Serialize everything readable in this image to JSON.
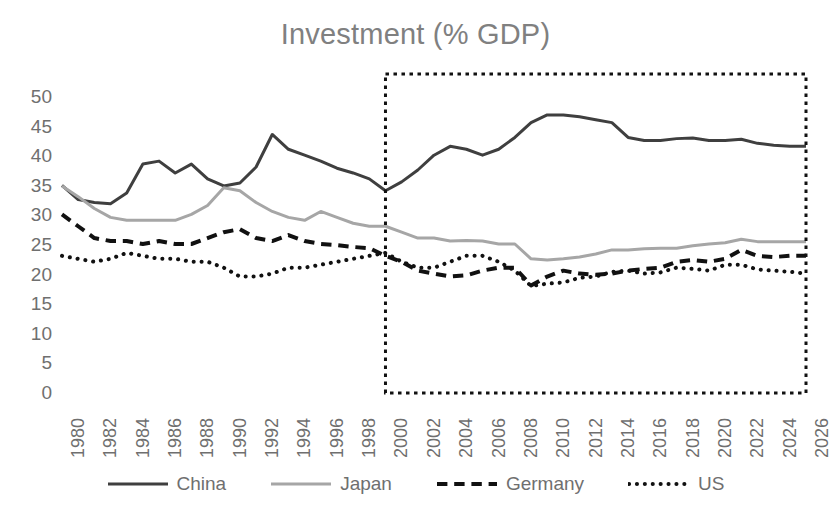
{
  "chart_data": {
    "type": "line",
    "title": "Investment (% GDP)",
    "xlabel": "",
    "ylabel": "",
    "ylim": [
      0,
      50
    ],
    "ytick_step": 5,
    "yticks": [
      50,
      45,
      40,
      35,
      30,
      25,
      20,
      15,
      10,
      5,
      0
    ],
    "xlim": [
      1980,
      2026
    ],
    "xticks": [
      1980,
      1982,
      1984,
      1986,
      1988,
      1990,
      1992,
      1994,
      1996,
      1998,
      2000,
      2002,
      2004,
      2006,
      2008,
      2010,
      2012,
      2014,
      2016,
      2018,
      2020,
      2022,
      2024,
      2026
    ],
    "x": [
      1980,
      1981,
      1982,
      1983,
      1984,
      1985,
      1986,
      1987,
      1988,
      1989,
      1990,
      1991,
      1992,
      1993,
      1994,
      1995,
      1996,
      1997,
      1998,
      1999,
      2000,
      2001,
      2002,
      2003,
      2004,
      2005,
      2006,
      2007,
      2008,
      2009,
      2010,
      2011,
      2012,
      2013,
      2014,
      2015,
      2016,
      2017,
      2018,
      2019,
      2020,
      2021,
      2022,
      2023,
      2024,
      2025,
      2026
    ],
    "grid": false,
    "legend_position": "bottom",
    "series": [
      {
        "name": "China",
        "style": "solid",
        "color": "#3f3f3f",
        "width": 3,
        "values": [
          34.9,
          32.5,
          32.0,
          31.8,
          33.6,
          38.5,
          39.0,
          37.0,
          38.5,
          36.0,
          34.8,
          35.3,
          38.0,
          43.5,
          41.0,
          40.0,
          39.0,
          37.8,
          37.0,
          36.0,
          34.0,
          35.5,
          37.5,
          40.0,
          41.5,
          41.0,
          40.0,
          41.0,
          43.0,
          45.5,
          46.8,
          46.8,
          46.5,
          46.0,
          45.5,
          43.0,
          42.5,
          42.5,
          42.8,
          42.9,
          42.5,
          42.5,
          42.7,
          42.0,
          41.7,
          41.5,
          41.5
        ]
      },
      {
        "name": "Japan",
        "style": "solid",
        "color": "#a6a6a6",
        "width": 3,
        "values": [
          34.8,
          33.0,
          31.0,
          29.5,
          29.0,
          29.0,
          29.0,
          29.0,
          30.0,
          31.5,
          34.5,
          34.0,
          32.0,
          30.5,
          29.5,
          29.0,
          30.5,
          29.5,
          28.5,
          28.0,
          28.0,
          27.0,
          26.0,
          26.0,
          25.5,
          25.6,
          25.5,
          25.0,
          25.0,
          22.5,
          22.3,
          22.5,
          22.8,
          23.3,
          24.0,
          24.0,
          24.2,
          24.3,
          24.3,
          24.7,
          25.0,
          25.2,
          25.8,
          25.4,
          25.4,
          25.4,
          25.4
        ]
      },
      {
        "name": "Germany",
        "style": "dashed",
        "color": "#111111",
        "width": 4,
        "values": [
          30.0,
          28.0,
          26.0,
          25.5,
          25.5,
          25.0,
          25.5,
          25.0,
          25.0,
          26.0,
          27.0,
          27.5,
          26.0,
          25.5,
          26.5,
          25.5,
          25.0,
          24.8,
          24.5,
          24.3,
          23.0,
          22.0,
          20.5,
          20.0,
          19.5,
          19.7,
          20.5,
          21.0,
          21.0,
          18.0,
          19.5,
          20.5,
          20.0,
          19.8,
          20.0,
          20.5,
          20.8,
          21.0,
          22.0,
          22.3,
          22.0,
          22.5,
          24.0,
          23.0,
          22.8,
          23.0,
          23.0
        ]
      },
      {
        "name": "US",
        "style": "dotted",
        "color": "#111111",
        "width": 4,
        "values": [
          23.0,
          22.5,
          22.0,
          22.5,
          23.5,
          23.0,
          22.5,
          22.5,
          22.0,
          22.0,
          21.0,
          19.5,
          19.5,
          20.0,
          21.0,
          21.0,
          21.5,
          22.0,
          22.5,
          23.0,
          23.5,
          22.0,
          21.0,
          21.0,
          22.0,
          23.0,
          23.0,
          22.0,
          20.5,
          17.9,
          18.3,
          18.5,
          19.3,
          19.5,
          20.3,
          20.5,
          20.0,
          20.2,
          21.0,
          20.8,
          20.5,
          21.5,
          21.5,
          20.7,
          20.5,
          20.3,
          20.0
        ]
      }
    ]
  },
  "highlight_box": {
    "label": "forecast-period-box",
    "start_year": 2000,
    "end_year": 2026,
    "style": "dotted",
    "color": "#111111"
  }
}
